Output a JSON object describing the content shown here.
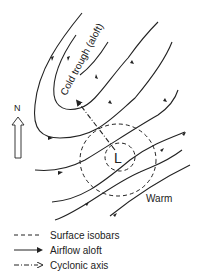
{
  "diagram": {
    "trough_label": "Cold trough (aloft)",
    "low_label": "L",
    "warm_label": "Warm",
    "north_label": "N"
  },
  "legend": {
    "items": [
      {
        "label": "Surface isobars",
        "style": "dashed"
      },
      {
        "label": "Airflow aloft",
        "style": "solid-arrow"
      },
      {
        "label": "Cyclonic axis",
        "style": "dash-dot-arrow"
      }
    ]
  },
  "colors": {
    "line": "#222222",
    "background": "#ffffff"
  }
}
